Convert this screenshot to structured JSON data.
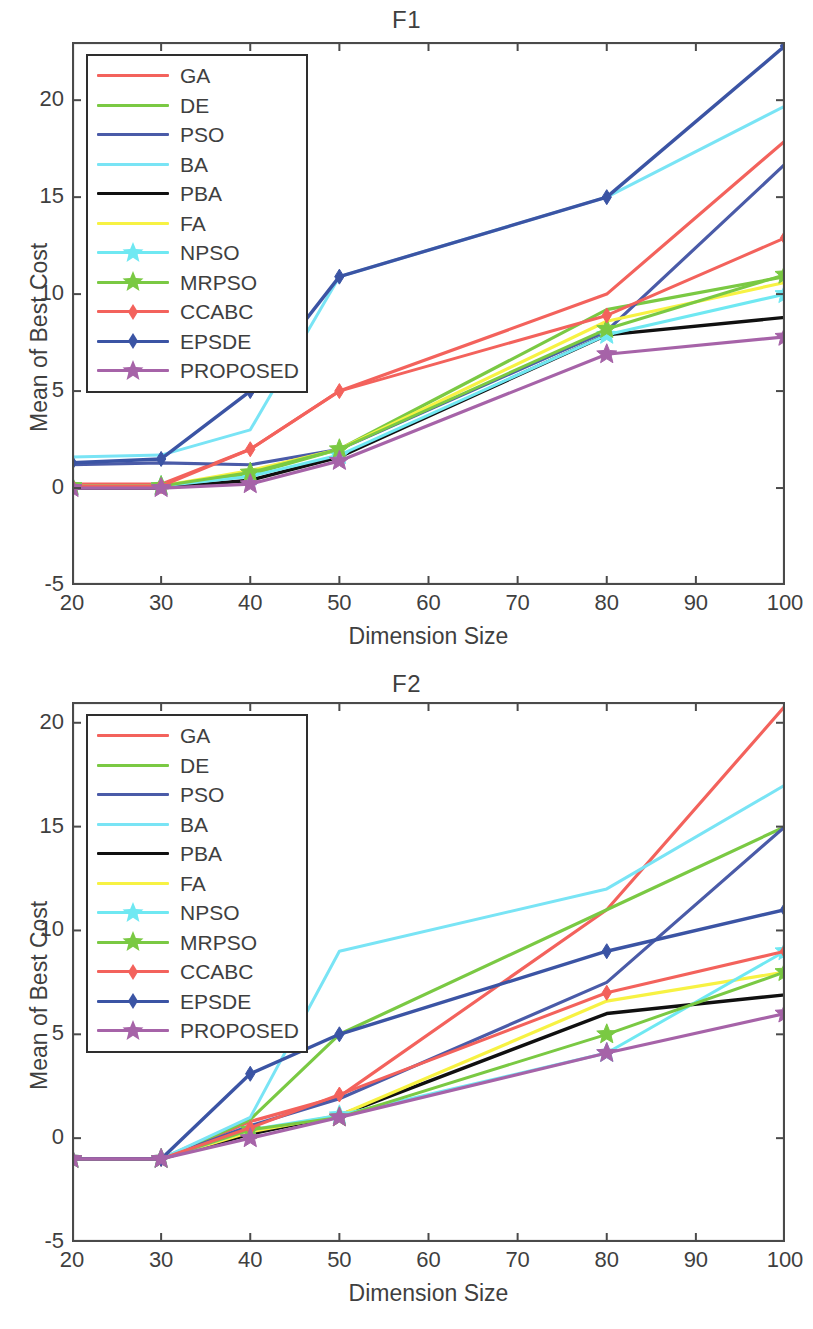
{
  "series_defs": [
    {
      "key": "GA",
      "label": "GA",
      "color": "#F3625C",
      "marker": "none",
      "width": 3.2
    },
    {
      "key": "DE",
      "label": "DE",
      "color": "#7AC943",
      "marker": "none",
      "width": 3.2
    },
    {
      "key": "PSO",
      "label": "PSO",
      "color": "#4A5BA8",
      "marker": "none",
      "width": 3.2
    },
    {
      "key": "BA",
      "label": "BA",
      "color": "#79E4F5",
      "marker": "none",
      "width": 3.0
    },
    {
      "key": "PBA",
      "label": "PBA",
      "color": "#101010",
      "marker": "none",
      "width": 3.4
    },
    {
      "key": "FA",
      "label": "FA",
      "color": "#F7F243",
      "marker": "none",
      "width": 3.2
    },
    {
      "key": "NPSO",
      "label": "NPSO",
      "color": "#6FE8F2",
      "marker": "star",
      "width": 3.0
    },
    {
      "key": "MRPSO",
      "label": "MRPSO",
      "color": "#7AC943",
      "marker": "star",
      "width": 3.0
    },
    {
      "key": "CCABC",
      "label": "CCABC",
      "color": "#F3625C",
      "marker": "diamond",
      "width": 3.0
    },
    {
      "key": "EPSDE",
      "label": "EPSDE",
      "color": "#3B54A4",
      "marker": "diamond",
      "width": 3.4
    },
    {
      "key": "PROPOSED",
      "label": "PROPOSED",
      "color": "#A663A8",
      "marker": "star",
      "width": 3.2
    }
  ],
  "charts": [
    {
      "id": "f1",
      "chart_title": "F1",
      "xlabel": "Dimension Size",
      "ylabel": "Mean of Best Cost",
      "xticks": [
        20,
        30,
        40,
        50,
        60,
        70,
        80,
        90,
        100
      ],
      "yticks": [
        -5,
        0,
        5,
        10,
        15,
        20
      ],
      "xlim": [
        20,
        100
      ],
      "ylim": [
        -5,
        23
      ],
      "legend_position": "top-left"
    },
    {
      "id": "f2",
      "chart_title": "F2",
      "xlabel": "Dimension Size",
      "ylabel": "Mean of Best Cost",
      "xticks": [
        20,
        30,
        40,
        50,
        60,
        70,
        80,
        90,
        100
      ],
      "yticks": [
        -5,
        0,
        5,
        10,
        15,
        20
      ],
      "xlim": [
        20,
        100
      ],
      "ylim": [
        -5,
        21
      ],
      "legend_position": "top-left"
    }
  ],
  "chart_data": [
    {
      "type": "line",
      "title": "F1",
      "xlabel": "Dimension Size",
      "ylabel": "Mean of Best Cost",
      "xlim": [
        20,
        100
      ],
      "ylim": [
        -5,
        23
      ],
      "xticks": [
        20,
        30,
        40,
        50,
        60,
        70,
        80,
        90,
        100
      ],
      "yticks": [
        -5,
        0,
        5,
        10,
        15,
        20
      ],
      "grid": false,
      "legend_position": "upper left",
      "x": [
        20,
        30,
        40,
        50,
        80,
        100
      ],
      "series": [
        {
          "name": "GA",
          "color": "#F3625C",
          "values": [
            0.2,
            0.2,
            2.0,
            5.0,
            10.0,
            17.9
          ]
        },
        {
          "name": "DE",
          "color": "#7AC943",
          "values": [
            0.1,
            0.1,
            0.7,
            2.0,
            9.2,
            10.9
          ]
        },
        {
          "name": "PSO",
          "color": "#4A5BA8",
          "values": [
            1.2,
            1.3,
            1.2,
            2.0,
            8.1,
            16.7
          ]
        },
        {
          "name": "BA",
          "color": "#79E4F5",
          "values": [
            1.6,
            1.7,
            3.0,
            10.9,
            15.0,
            19.7
          ]
        },
        {
          "name": "PBA",
          "color": "#101010",
          "values": [
            0.0,
            0.0,
            0.4,
            1.6,
            7.9,
            8.8
          ]
        },
        {
          "name": "FA",
          "color": "#F7F243",
          "values": [
            0.1,
            0.1,
            0.9,
            2.0,
            8.6,
            10.6
          ]
        },
        {
          "name": "NPSO",
          "color": "#6FE8F2",
          "values": [
            0.1,
            0.1,
            0.6,
            1.7,
            7.9,
            10.0
          ]
        },
        {
          "name": "MRPSO",
          "color": "#7AC943",
          "values": [
            0.1,
            0.1,
            0.8,
            2.0,
            8.2,
            11.0
          ]
        },
        {
          "name": "CCABC",
          "color": "#F3625C",
          "values": [
            0.1,
            0.1,
            2.0,
            5.0,
            8.9,
            12.9
          ]
        },
        {
          "name": "EPSDE",
          "color": "#3B54A4",
          "values": [
            1.3,
            1.5,
            5.0,
            10.9,
            15.0,
            22.8
          ]
        },
        {
          "name": "PROPOSED",
          "color": "#A663A8",
          "values": [
            0.0,
            0.0,
            0.2,
            1.4,
            6.9,
            7.8
          ]
        }
      ]
    },
    {
      "type": "line",
      "title": "F2",
      "xlabel": "Dimension Size",
      "ylabel": "Mean of Best Cost",
      "xlim": [
        20,
        100
      ],
      "ylim": [
        -5,
        21
      ],
      "xticks": [
        20,
        30,
        40,
        50,
        60,
        70,
        80,
        90,
        100
      ],
      "yticks": [
        -5,
        0,
        5,
        10,
        15,
        20
      ],
      "grid": false,
      "legend_position": "upper left",
      "x": [
        20,
        30,
        40,
        50,
        80,
        100
      ],
      "series": [
        {
          "name": "GA",
          "color": "#F3625C",
          "values": [
            -1,
            -1,
            0.8,
            2.0,
            11.0,
            20.8
          ]
        },
        {
          "name": "DE",
          "color": "#7AC943",
          "values": [
            -1,
            -1,
            0.9,
            5.0,
            11.0,
            15.0
          ]
        },
        {
          "name": "PSO",
          "color": "#4A5BA8",
          "values": [
            -1,
            -1,
            0.6,
            1.9,
            7.5,
            15.0
          ]
        },
        {
          "name": "BA",
          "color": "#79E4F5",
          "values": [
            -1,
            -1,
            1.0,
            9.0,
            12.0,
            17.0
          ]
        },
        {
          "name": "PBA",
          "color": "#101010",
          "values": [
            -1,
            -1,
            0.2,
            1.1,
            6.0,
            6.9
          ]
        },
        {
          "name": "FA",
          "color": "#F7F243",
          "values": [
            -1,
            -1,
            0.3,
            1.1,
            6.6,
            8.0
          ]
        },
        {
          "name": "NPSO",
          "color": "#6FE8F2",
          "values": [
            -1,
            -1,
            0.4,
            1.1,
            4.1,
            9.0
          ]
        },
        {
          "name": "MRPSO",
          "color": "#7AC943",
          "values": [
            -1,
            -1,
            0.4,
            1.0,
            5.0,
            8.0
          ]
        },
        {
          "name": "CCABC",
          "color": "#F3625C",
          "values": [
            -1,
            -1,
            0.5,
            2.1,
            7.0,
            9.0
          ]
        },
        {
          "name": "EPSDE",
          "color": "#3B54A4",
          "values": [
            -1,
            -1,
            3.1,
            5.0,
            9.0,
            11.0
          ]
        },
        {
          "name": "PROPOSED",
          "color": "#A663A8",
          "values": [
            -1,
            -1,
            0.0,
            1.0,
            4.1,
            6.0
          ]
        }
      ]
    }
  ]
}
